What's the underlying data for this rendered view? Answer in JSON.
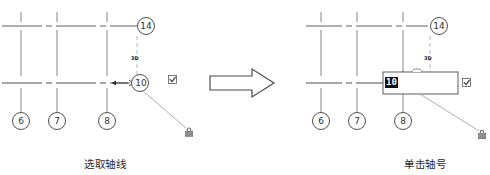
{
  "figure": {
    "title": "",
    "panels": [
      {
        "id": "left",
        "caption": "选取轴线",
        "grid": {
          "horizontal_axes": [
            {
              "label": "14",
              "y": 25
            },
            {
              "label": "10",
              "y": 85,
              "selected": true
            }
          ],
          "vertical_axes": [
            {
              "label": "6"
            },
            {
              "label": "7"
            },
            {
              "label": "8"
            }
          ],
          "annotation": "3D"
        },
        "icons": {
          "checkbox": "checkbox-checked-icon",
          "lock": "padlock-icon",
          "cursor": "crosshair-cursor-icon"
        },
        "edit_box": null
      },
      {
        "id": "right",
        "caption": "单击轴号",
        "grid": {
          "horizontal_axes": [
            {
              "label": "14",
              "y": 25
            },
            {
              "label": "10",
              "y": 85,
              "selected": true
            }
          ],
          "vertical_axes": [
            {
              "label": "6"
            },
            {
              "label": "7"
            },
            {
              "label": "8"
            }
          ],
          "annotation": "3D"
        },
        "icons": {
          "checkbox": "checkbox-checked-icon",
          "lock": "padlock-icon"
        },
        "edit_box": {
          "value": "10",
          "selected": true,
          "placeholder": ""
        }
      }
    ],
    "transition_arrow": "block-arrow-right-icon"
  },
  "colors": {
    "line": "#3a3a3a",
    "dash": "#555555",
    "text": "#2b2b2b",
    "selection_bg": "#111111",
    "selection_fg": "#ffffff",
    "box_border": "#444444",
    "leader": "#7a7a7a"
  }
}
